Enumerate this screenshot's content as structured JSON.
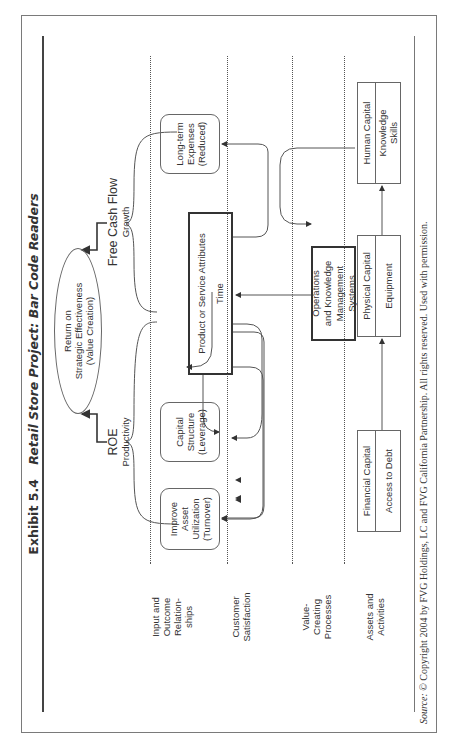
{
  "exhibit": {
    "number": "Exhibit 5.4",
    "title": "Retail Store Project: Bar Code Readers"
  },
  "top": {
    "goal": "Return on Strategic Effectiveness (Value Creation)",
    "goal_lines": [
      "Return on",
      "Strategic Effectiveness",
      "(Value Creation)"
    ],
    "left_branch": {
      "label": "ROE",
      "sublabel": "Productivity"
    },
    "right_branch": {
      "label": "Free Cash Flow",
      "sublabel": "Growth"
    }
  },
  "rows": [
    {
      "id": "input_outcome",
      "label_lines": [
        "Input and",
        "Outcome",
        "Relation-",
        "ships"
      ]
    },
    {
      "id": "customer",
      "label_lines": [
        "Customer",
        "Satisfaction"
      ]
    },
    {
      "id": "value_creating",
      "label_lines": [
        "Value-",
        "Creating",
        "Processes"
      ]
    },
    {
      "id": "assets",
      "label_lines": [
        "Assets and",
        "Activities"
      ]
    }
  ],
  "outcome_boxes": [
    {
      "id": "asset_util",
      "lines": [
        "Improve Asset",
        "Utilization",
        "(Turnover)"
      ]
    },
    {
      "id": "capital_structure",
      "lines": [
        "Capital",
        "Structure",
        "(Leverage)"
      ]
    },
    {
      "id": "long_term_expenses",
      "lines": [
        "Long-term",
        "Expenses",
        "(Reduced)"
      ]
    }
  ],
  "customer_box": {
    "title": "Product or Service Attributes",
    "subtitle": "Time"
  },
  "process_box": {
    "lines": [
      "Operations",
      "and Knowledge",
      "Management Systems"
    ]
  },
  "asset_boxes": [
    {
      "id": "financial",
      "header": "Financial Capital",
      "body_lines": [
        "Access to Debt"
      ]
    },
    {
      "id": "physical",
      "header": "Physical Capital",
      "body_lines": [
        "Equipment"
      ]
    },
    {
      "id": "human",
      "header": "Human Capital",
      "body_lines": [
        "Knowledge",
        "Skills"
      ]
    }
  ],
  "source": {
    "lead": "Source:",
    "text": "© Copyright 2004 by FVG Holdings, LC and FVG California Partnership. All rights reserved. Used with permission."
  },
  "colors": {
    "line": "#444444",
    "frame": "#7a7a7a",
    "text": "#333333"
  }
}
